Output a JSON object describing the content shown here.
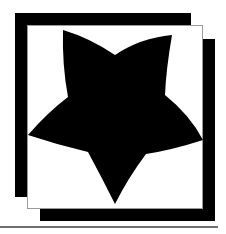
{
  "graphic": {
    "description": "Black five-pointed curved star inside an offset black-and-white frame",
    "colors": {
      "frame": "#000000",
      "panel": "#ffffff",
      "panel_border": "#9a9a9a",
      "star": "#000000",
      "baseline": "#6f6f6f"
    },
    "star_points": [
      [
        63,
        30
      ],
      [
        172,
        35
      ],
      [
        203,
        140
      ],
      [
        115,
        204
      ],
      [
        28,
        135
      ]
    ],
    "star_notches": [
      [
        115,
        55
      ],
      [
        165,
        95
      ],
      [
        146,
        154
      ],
      [
        88,
        152
      ],
      [
        68,
        97
      ]
    ]
  }
}
